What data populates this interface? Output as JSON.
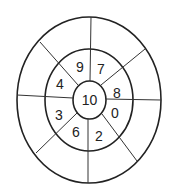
{
  "diagram": {
    "type": "concentric-rings",
    "center_value": "10",
    "middle_ring_values": [
      {
        "label": "9",
        "x": 80,
        "y": 72
      },
      {
        "label": "7",
        "x": 101,
        "y": 74
      },
      {
        "label": "4",
        "x": 60,
        "y": 89
      },
      {
        "label": "8",
        "x": 117,
        "y": 98
      },
      {
        "label": "3",
        "x": 59,
        "y": 120
      },
      {
        "label": "0",
        "x": 115,
        "y": 118
      },
      {
        "label": "6",
        "x": 76,
        "y": 137
      },
      {
        "label": "2",
        "x": 99,
        "y": 141
      }
    ],
    "outer_ring_values": []
  }
}
